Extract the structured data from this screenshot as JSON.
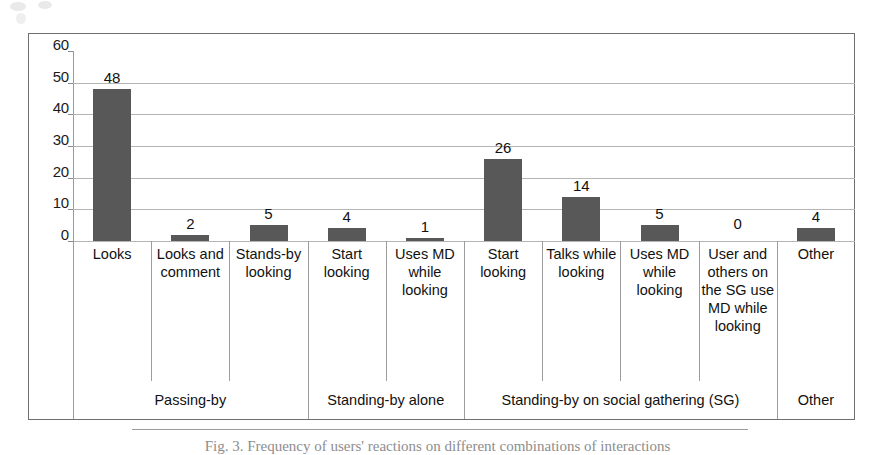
{
  "figure": {
    "caption": "Fig. 3. Frequency of users' reactions on different combinations of interactions"
  },
  "chart_data": {
    "type": "bar",
    "title": "",
    "xlabel": "",
    "ylabel": "",
    "ylim": [
      0,
      60
    ],
    "yticks": [
      0,
      10,
      20,
      30,
      40,
      50,
      60
    ],
    "ytick_labels": [
      "0",
      "10",
      "20",
      "30",
      "40",
      "50",
      "60"
    ],
    "grid": true,
    "legend": "none",
    "bar_color": "#585858",
    "categories": [
      "Looks",
      "Looks and comment",
      "Stands-by looking",
      "Start looking",
      "Uses MD while looking",
      "Start looking",
      "Talks while looking",
      "Uses MD while looking",
      "User and others on the SG use MD while looking",
      "Other"
    ],
    "values": [
      48,
      2,
      5,
      4,
      1,
      26,
      14,
      5,
      0,
      4
    ],
    "value_labels": [
      "48",
      "2",
      "5",
      "4",
      "1",
      "26",
      "14",
      "5",
      "0",
      "4"
    ],
    "groups": [
      {
        "label": "Passing-by",
        "span": 3
      },
      {
        "label": "Standing-by alone",
        "span": 2
      },
      {
        "label": "Standing-by on social gathering (SG)",
        "span": 4
      },
      {
        "label": "Other",
        "span": 1
      }
    ]
  }
}
